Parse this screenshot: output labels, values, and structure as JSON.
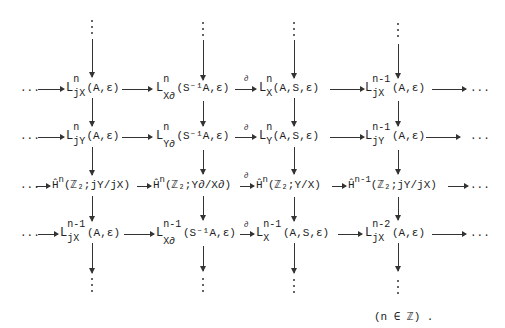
{
  "diagram": {
    "type": "commutative-diagram",
    "leading": "...",
    "trailing": "...",
    "boundary_label": "∂",
    "rows": [
      {
        "nodes": [
          {
            "base": "L",
            "sup": "n",
            "sub": "jX",
            "args": "(A,ε)"
          },
          {
            "base": "L",
            "sup": "n",
            "sub": "X∂",
            "args": "(S⁻¹A,ε)"
          },
          {
            "base": "L",
            "sup": "n",
            "sub": "X",
            "args": "(A,S,ε)"
          },
          {
            "base": "L",
            "sup": "n-1",
            "sub": "jX",
            "args": "(A,ε)"
          }
        ]
      },
      {
        "nodes": [
          {
            "base": "L",
            "sup": "n",
            "sub": "jY",
            "args": "(A,ε)"
          },
          {
            "base": "L",
            "sup": "n",
            "sub": "Y∂",
            "args": "(S⁻¹A,ε)"
          },
          {
            "base": "L",
            "sup": "n",
            "sub": "Y",
            "args": "(A,S,ε)"
          },
          {
            "base": "L",
            "sup": "n-1",
            "sub": "jY",
            "args": "(A,ε)"
          }
        ]
      },
      {
        "nodes": [
          {
            "base": "Ĥ",
            "sup": "n",
            "args": "(ℤ₂;jY/jX)"
          },
          {
            "base": "Ĥ",
            "sup": "n",
            "args": "(ℤ₂;Y∂/X∂)"
          },
          {
            "base": "Ĥ",
            "sup": "n",
            "args": "(ℤ₂;Y/X)"
          },
          {
            "base": "Ĥ",
            "sup": "n-1",
            "args": "(ℤ₂;jY/jX)"
          }
        ]
      },
      {
        "nodes": [
          {
            "base": "L",
            "sup": "n-1",
            "sub": "jX",
            "args": "(A,ε)"
          },
          {
            "base": "L",
            "sup": "n-1",
            "sub": "X∂",
            "args": "(S⁻¹A,ε)"
          },
          {
            "base": "L",
            "sup": "n-1",
            "sub": "X",
            "args": "(A,S,ε)"
          },
          {
            "base": "L",
            "sup": "n-2",
            "sub": "jX",
            "args": "(A,ε)"
          }
        ]
      }
    ],
    "footer": "(n ∈ ℤ)   ."
  }
}
